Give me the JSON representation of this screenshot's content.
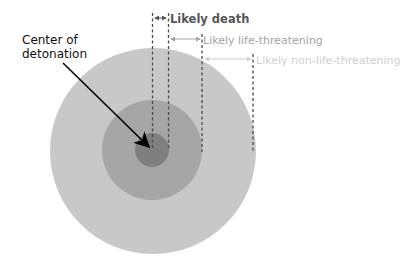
{
  "diagram": {
    "title_label": {
      "line1": "Center of",
      "line2": "detonation",
      "color": "#111111"
    },
    "zones": [
      {
        "id": "death",
        "label": "Likely death",
        "fill": "#7f7f7f",
        "label_color": "#555555",
        "radius": 17
      },
      {
        "id": "life-threatening",
        "label": "Likely life-threatening",
        "fill": "#a6a6a6",
        "label_color": "#a3a3a3",
        "radius": 50
      },
      {
        "id": "non-life-threatening",
        "label": "Likely non-life-threatening",
        "fill": "#c8c8c8",
        "label_color": "#cfcfcf",
        "radius": 103
      }
    ],
    "center": {
      "x": 152,
      "y": 151
    },
    "colors": {
      "dashed_line": "#4a4a4a",
      "pointer_arrow": "#000000",
      "background": "#ffffff"
    }
  }
}
